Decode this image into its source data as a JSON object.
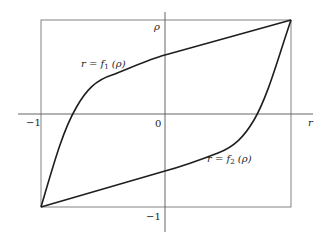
{
  "figure": {
    "type": "diagram",
    "colors": {
      "background": "#ffffff",
      "axis": "#555555",
      "box": "#777777",
      "curve": "#1e1e1e",
      "text": "#222222"
    }
  },
  "axes": {
    "x_label": "r",
    "y_label": "ρ",
    "origin_label": "0",
    "x_min_label": "−1",
    "y_min_label": "−1"
  },
  "curves": [
    {
      "name": "f1",
      "label_prefix": "r = f",
      "subscript": "1",
      "label_suffix": " (ρ)",
      "endpoints": [
        [
          -1,
          -1
        ],
        [
          1,
          1
        ]
      ]
    },
    {
      "name": "f2",
      "label_prefix": "r = f",
      "subscript": "2",
      "label_suffix": " (ρ)",
      "endpoints": [
        [
          -1,
          -1
        ],
        [
          1,
          1
        ]
      ]
    }
  ],
  "box": {
    "x_range": [
      -1,
      1
    ],
    "y_range": [
      -1,
      1
    ]
  }
}
